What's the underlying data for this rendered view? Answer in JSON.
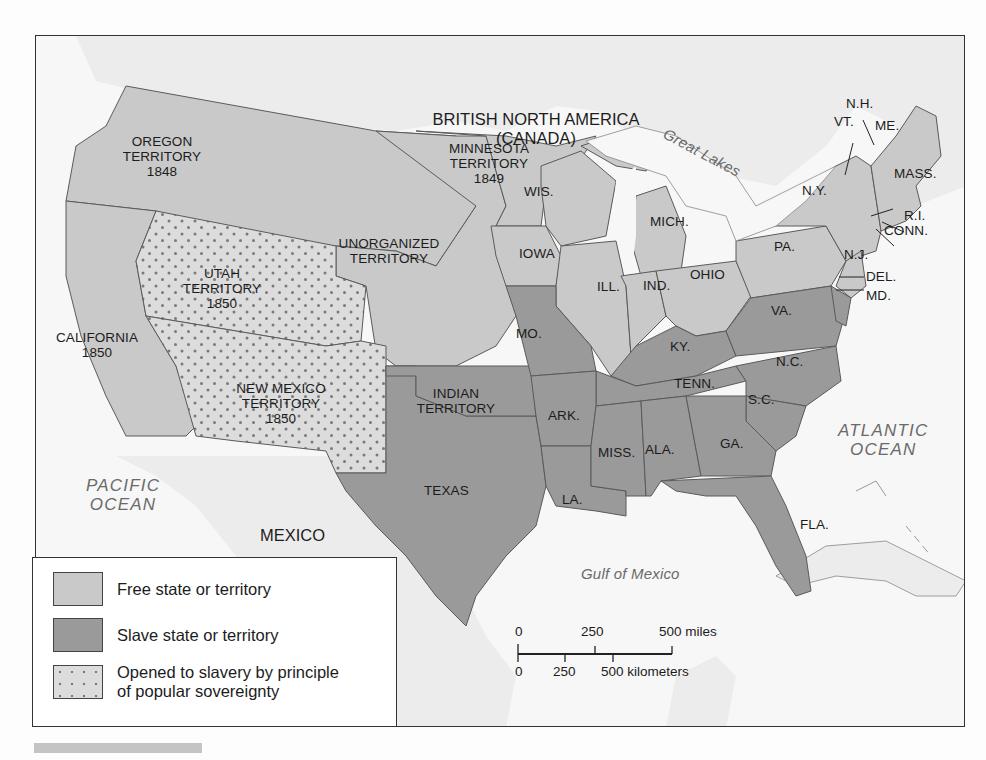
{
  "map": {
    "colors": {
      "free": "#c9c9c9",
      "slave": "#9a9a9a",
      "popular_sovereignty": "#dcdcdc",
      "popular_sovereignty_dots": "#7a7a7a",
      "water": "#f7f7f7",
      "foreign_land": "#ececec",
      "border": "#5a5a5a"
    },
    "regions": {
      "canada": "BRITISH NORTH AMERICA",
      "canada_sub": "(CANADA)",
      "mexico": "MEXICO",
      "great_lakes": "Great Lakes",
      "pacific_1": "PACIFIC",
      "pacific_2": "OCEAN",
      "atlantic_1": "ATLANTIC",
      "atlantic_2": "OCEAN",
      "gulf": "Gulf of Mexico"
    },
    "territories": {
      "oregon": [
        "OREGON",
        "TERRITORY",
        "1848"
      ],
      "minnesota": [
        "MINNESOTA",
        "TERRITORY",
        "1849"
      ],
      "unorganized": [
        "UNORGANIZED",
        "TERRITORY"
      ],
      "utah": [
        "UTAH",
        "TERRITORY",
        "1850"
      ],
      "california": [
        "CALIFORNIA",
        "1850"
      ],
      "new_mexico": [
        "NEW MEXICO",
        "TERRITORY",
        "1850"
      ],
      "indian": [
        "INDIAN",
        "TERRITORY"
      ]
    },
    "states": {
      "wis": "WIS.",
      "mich": "MICH.",
      "iowa": "IOWA",
      "ill": "ILL.",
      "ind": "IND.",
      "ohio": "OHIO",
      "mo": "MO.",
      "ky": "KY.",
      "tenn": "TENN.",
      "ark": "ARK.",
      "miss": "MISS.",
      "ala": "ALA.",
      "ga": "GA.",
      "la": "LA.",
      "fla": "FLA.",
      "texas": "TEXAS",
      "sc": "S.C.",
      "nc": "N.C.",
      "va": "VA.",
      "pa": "PA.",
      "ny": "N.Y.",
      "nj": "N.J.",
      "del": "DEL.",
      "md": "MD.",
      "conn": "CONN.",
      "ri": "R.I.",
      "mass": "MASS.",
      "vt": "VT.",
      "nh": "N.H.",
      "me": "ME."
    }
  },
  "legend": {
    "items": [
      {
        "key": "free",
        "label": "Free state or territory"
      },
      {
        "key": "slave",
        "label": "Slave state or territory"
      },
      {
        "key": "popular_sovereignty",
        "label_line1": "Opened to slavery by principle",
        "label_line2": "of popular sovereignty"
      }
    ]
  },
  "scale": {
    "miles": {
      "t0": "0",
      "t1": "250",
      "t2": "500 miles"
    },
    "km": {
      "t0": "0",
      "t1": "250",
      "t2": "500 kilometers"
    }
  }
}
